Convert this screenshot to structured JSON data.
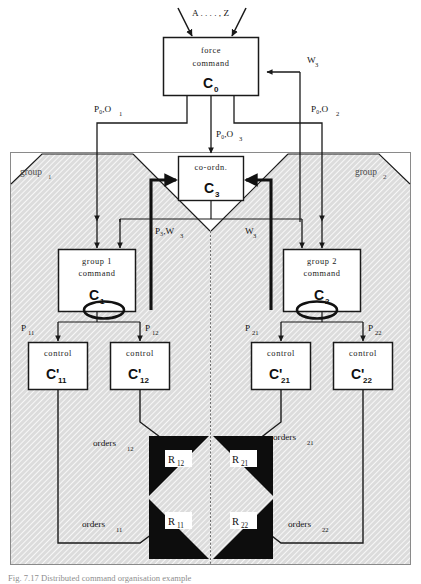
{
  "figure": {
    "title": "Distributed command organisation example",
    "caption": "Fig. 7.17     Distributed command organisation example",
    "background_color": "#ffffff",
    "line_color": "#1a1a1a",
    "shade_color": "#d9d9d9",
    "node_fill": "#ffffff",
    "resource_fill": "#0d0d0d"
  },
  "input_label": {
    "text": "A . . . . , Z",
    "name": "external-input-label"
  },
  "nodes": {
    "force_command": {
      "line1": "force",
      "line2": "command",
      "symbol": "C",
      "subscript": "0"
    },
    "coordination": {
      "line1": "co-ordn.",
      "symbol": "C",
      "subscript": "3"
    },
    "group1_command": {
      "line1": "group  1",
      "line2": "command",
      "symbol": "C",
      "subscript": "1"
    },
    "group2_command": {
      "line1": "group  2",
      "line2": "command",
      "symbol": "C",
      "subscript": "2"
    },
    "control_11": {
      "line1": "control",
      "symbol": "C'",
      "subscript": "11"
    },
    "control_12": {
      "line1": "control",
      "symbol": "C'",
      "subscript": "12"
    },
    "control_21": {
      "line1": "control",
      "symbol": "C'",
      "subscript": "21"
    },
    "control_22": {
      "line1": "control",
      "symbol": "C'",
      "subscript": "22"
    }
  },
  "resources": {
    "r12": {
      "symbol": "R",
      "subscript": "12"
    },
    "r21": {
      "symbol": "R",
      "subscript": "21"
    },
    "r11": {
      "symbol": "R",
      "subscript": "11"
    },
    "r22": {
      "symbol": "R",
      "subscript": "22"
    }
  },
  "groups": {
    "group1": {
      "text": "group",
      "subscript": "1"
    },
    "group2": {
      "text": "group",
      "subscript": "2"
    }
  },
  "edge_labels": {
    "p0o1": {
      "text": "P₀,O",
      "subscript": "1"
    },
    "p0o2": {
      "text": "P₀,O",
      "subscript": "2"
    },
    "p0o3": {
      "text": "P₀,O",
      "subscript": "3"
    },
    "w3_top": {
      "text": "W",
      "subscript": "3"
    },
    "p3w3": {
      "text": "P₃,W",
      "subscript": "3"
    },
    "w3_mid": {
      "text": "W",
      "subscript": "3"
    },
    "p11": {
      "text": "P",
      "subscript": "11"
    },
    "p12": {
      "text": "P",
      "subscript": "12"
    },
    "p21": {
      "text": "P",
      "subscript": "21"
    },
    "p22": {
      "text": "P",
      "subscript": "22"
    },
    "orders12": {
      "text": "orders",
      "subscript": "12"
    },
    "orders21": {
      "text": "orders",
      "subscript": "21"
    },
    "orders11": {
      "text": "orders",
      "subscript": "11"
    },
    "orders22": {
      "text": "orders",
      "subscript": "22"
    }
  }
}
